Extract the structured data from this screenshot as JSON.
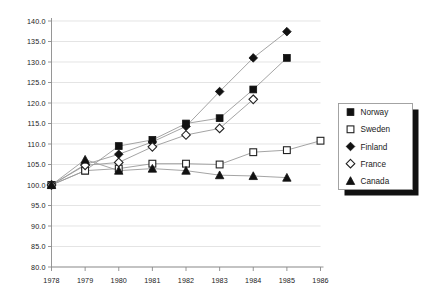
{
  "chart_data": {
    "type": "line",
    "title": "",
    "subtitle": "",
    "xlabel": "",
    "ylabel": "",
    "x": [
      1978,
      1979,
      1980,
      1981,
      1982,
      1983,
      1984,
      1985,
      1986
    ],
    "xtick_labels": [
      "1978",
      "1979",
      "1980",
      "1981",
      "1982",
      "1983",
      "1984",
      "1985",
      "1986"
    ],
    "ytick_labels": [
      "140.0",
      "135.0",
      "130.0",
      "125.0",
      "120.0",
      "115.0",
      "110.0",
      "105.0",
      "100.0",
      "95.0",
      "90.0",
      "85.0",
      "80.0"
    ],
    "ytick_values": [
      140.0,
      135.0,
      130.0,
      125.0,
      120.0,
      115.0,
      110.0,
      105.0,
      100.0,
      95.0,
      90.0,
      85.0,
      80.0
    ],
    "xlim": [
      1978,
      1986
    ],
    "ylim": [
      80.0,
      140.0
    ],
    "grid": true,
    "legend_position": "right",
    "series": [
      {
        "name": "Norway",
        "marker": "filled-square",
        "color": "#111111",
        "x": [
          1978,
          1979,
          1980,
          1981,
          1982,
          1983,
          1984,
          1985
        ],
        "values": [
          100.0,
          103.5,
          109.5,
          111.0,
          115.0,
          116.3,
          123.3,
          131.0
        ]
      },
      {
        "name": "Sweden",
        "marker": "open-square",
        "color": "#ffffff",
        "x": [
          1978,
          1979,
          1980,
          1981,
          1982,
          1983,
          1984,
          1985,
          1986
        ],
        "values": [
          100.0,
          103.5,
          104.0,
          105.2,
          105.2,
          105.0,
          108.0,
          108.5,
          110.8
        ]
      },
      {
        "name": "Finland",
        "marker": "filled-diamond",
        "color": "#111111",
        "x": [
          1978,
          1979,
          1980,
          1981,
          1982,
          1983,
          1984,
          1985
        ],
        "values": [
          100.0,
          105.0,
          107.5,
          110.5,
          114.3,
          122.8,
          131.0,
          137.4
        ]
      },
      {
        "name": "France",
        "marker": "open-diamond",
        "color": "#ffffff",
        "x": [
          1978,
          1979,
          1980,
          1981,
          1982,
          1983,
          1984
        ],
        "values": [
          100.0,
          104.8,
          105.5,
          109.3,
          112.2,
          113.8,
          120.9
        ]
      },
      {
        "name": "Canada",
        "marker": "filled-triangle",
        "color": "#111111",
        "x": [
          1978,
          1979,
          1980,
          1981,
          1982,
          1983,
          1984,
          1985
        ],
        "values": [
          100.0,
          106.2,
          103.5,
          104.0,
          103.5,
          102.4,
          102.2,
          101.8
        ]
      }
    ]
  },
  "legend": {
    "items": [
      {
        "label": "Norway",
        "marker": "filled-square"
      },
      {
        "label": "Sweden",
        "marker": "open-square"
      },
      {
        "label": "Finland",
        "marker": "filled-diamond"
      },
      {
        "label": "France",
        "marker": "open-diamond"
      },
      {
        "label": "Canada",
        "marker": "filled-triangle"
      }
    ]
  },
  "colors": {
    "grid": "#d8d8d8",
    "axis": "#8a8a8a",
    "line": "#9a9a9a",
    "marker_filled": "#111111",
    "marker_open": "#ffffff",
    "text": "#1a1a1a",
    "legend_shadow": "#111111"
  }
}
